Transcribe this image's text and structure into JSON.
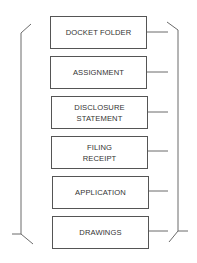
{
  "diagram": {
    "colors": {
      "line": "#6b6b6b",
      "box_border": "#555555",
      "text": "#333333"
    },
    "boxes": [
      {
        "label": "DOCKET FOLDER",
        "top": 16
      },
      {
        "label": "ASSIGNMENT",
        "top": 56
      },
      {
        "label": "DISCLOSURE\nSTATEMENT",
        "top": 96
      },
      {
        "label": "FILING\nRECEIPT",
        "top": 136
      },
      {
        "label": "APPLICATION",
        "top": 176
      },
      {
        "label": "DRAWINGS",
        "top": 216
      }
    ]
  }
}
